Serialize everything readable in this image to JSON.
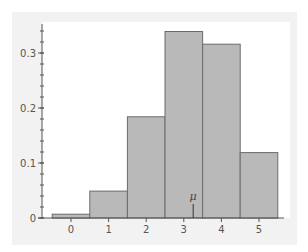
{
  "chart_data": {
    "type": "bar",
    "title": "",
    "xlabel": "",
    "ylabel": "",
    "categories": [
      "0",
      "1",
      "2",
      "3",
      "4",
      "5"
    ],
    "values": [
      0.007,
      0.049,
      0.184,
      0.339,
      0.316,
      0.119
    ],
    "ylim": [
      0,
      0.355
    ],
    "xlim": [
      -0.5,
      5.7
    ],
    "y_ticks": [
      0,
      0.1,
      0.2,
      0.3
    ],
    "y_tick_labels": [
      "0",
      "0.1",
      "0.2",
      "0.3"
    ],
    "y_minor_tick_step": 0.02,
    "x_ticks": [
      0,
      1,
      2,
      3,
      4,
      5
    ],
    "x_tick_labels": [
      "0",
      "1",
      "2",
      "3",
      "4",
      "5"
    ],
    "grid": false,
    "legend": null,
    "annotations": [
      {
        "type": "mean-marker",
        "label": "μ",
        "x": 3.25
      }
    ],
    "bar_width": 1.0
  },
  "colors": {
    "panel_background": "#f2f2f2",
    "plot_background": "#ffffff",
    "bar_fill": "#b9b9b9",
    "bar_stroke": "#6b6b6b",
    "axis": "#555555",
    "tick_label": "#555555"
  }
}
